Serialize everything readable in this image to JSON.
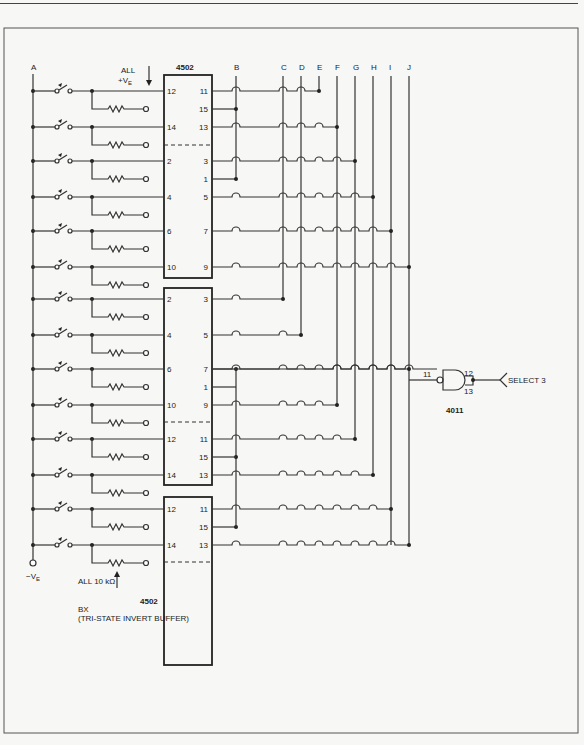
{
  "header": {
    "left_text": "MODULES AND SYSTEMS",
    "right_text": "377"
  },
  "labels": {
    "bus_a": "A",
    "all_ve_line1": "ALL",
    "all_ve_line2": "+V",
    "all_ve_sub": "E",
    "neg_ve": "−V",
    "neg_ve_sub": "E",
    "all_10k": "ALL 10 kΩ",
    "bx": "BX",
    "bx_desc": "(TRI-STATE INVERT BUFFER)",
    "gate_part": "4011",
    "gate_in1": "12",
    "gate_in2": "13",
    "gate_out": "11",
    "select": "SELECT 3"
  },
  "columns": [
    "B",
    "C",
    "D",
    "E",
    "F",
    "G",
    "H",
    "I",
    "J"
  ],
  "chips": [
    {
      "part": "4502",
      "show_part_top": true,
      "left_pins": [
        "12",
        "14",
        "2",
        "4",
        "6",
        "10"
      ],
      "right_pins": [
        "11",
        "15",
        "13",
        "3",
        "1",
        "5",
        "7",
        "9"
      ]
    },
    {
      "part": "4502",
      "show_part_top": false,
      "left_pins": [
        "2",
        "4",
        "6",
        "10",
        "12",
        "14"
      ],
      "right_pins": [
        "3",
        "5",
        "7",
        "1",
        "9",
        "11",
        "15",
        "13"
      ]
    },
    {
      "part": "4502",
      "show_part_top": false,
      "left_pins": [
        "12",
        "14"
      ],
      "right_pins": [
        "11",
        "15",
        "13"
      ]
    }
  ]
}
